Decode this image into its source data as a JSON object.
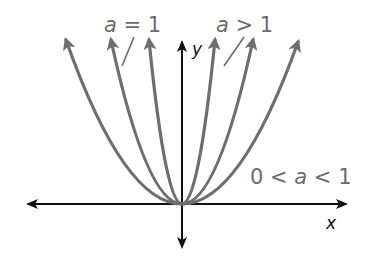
{
  "figure": {
    "axes": {
      "x_label": "x",
      "y_label": "y",
      "origin_px": [
        182,
        204
      ]
    },
    "curves": [
      {
        "name": "curve-a-greater-than-1",
        "group": "a > 1",
        "half_width_px": 33,
        "top_y_px": 40
      },
      {
        "name": "curve-a-equals-1",
        "group": "a = 1",
        "half_width_px": 71,
        "top_y_px": 40
      },
      {
        "name": "curve-a-between-0-and-1",
        "group": "0 < a < 1",
        "half_width_px": 116,
        "top_y_px": 40
      }
    ],
    "labels": {
      "a_equals_1": {
        "var": "a",
        "rel": " = 1"
      },
      "a_greater_1": {
        "var": "a",
        "rel": " > 1"
      },
      "a_between": {
        "pre": "0 < ",
        "var": "a",
        "rel": " < 1"
      }
    },
    "colors": {
      "curve": "#6e6e6e",
      "axis": "#111111",
      "label": "#6b6b6b"
    }
  }
}
